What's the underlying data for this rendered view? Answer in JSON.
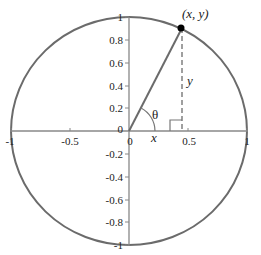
{
  "diagram": {
    "point_label": "(x, y)",
    "angle_label": "θ",
    "x_segment_label": "x",
    "y_segment_label": "y",
    "x_axis": {
      "range": [
        -1,
        1
      ],
      "ticks": [
        {
          "value": -1,
          "label": "-1"
        },
        {
          "value": -0.5,
          "label": "-0.5"
        },
        {
          "value": 0,
          "label": "0"
        },
        {
          "value": 0.5,
          "label": "0.5"
        },
        {
          "value": 1,
          "label": "1"
        }
      ]
    },
    "y_axis": {
      "range": [
        -1,
        1
      ],
      "ticks": [
        {
          "value": 1,
          "label": "1"
        },
        {
          "value": 0.8,
          "label": "0.8"
        },
        {
          "value": 0.6,
          "label": "0.6"
        },
        {
          "value": 0.4,
          "label": "0.4"
        },
        {
          "value": 0.2,
          "label": "0.2"
        },
        {
          "value": 0,
          "label": "0"
        },
        {
          "value": -0.2,
          "label": "-0.2"
        },
        {
          "value": -0.4,
          "label": "-0.4"
        },
        {
          "value": -0.6,
          "label": "-0.6"
        },
        {
          "value": -0.8,
          "label": "-0.8"
        },
        {
          "value": -1,
          "label": "-1"
        }
      ]
    },
    "point": {
      "x": 0.45,
      "y": 0.9
    },
    "colors": {
      "circle": "#6b6b6b",
      "axes": "#888888",
      "radius_line": "#6b6b6b",
      "dashed_line": "#888888",
      "point": "#000000",
      "text": "#222222"
    }
  }
}
